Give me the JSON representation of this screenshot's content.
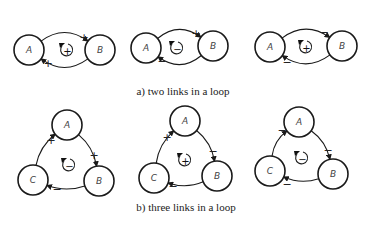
{
  "captions": {
    "a": "a) two links in a loop",
    "b": "b) three links in a loop"
  },
  "node_radius": 15,
  "panels": [
    {
      "id": "a1",
      "nodes": [
        {
          "label": "A",
          "x": 29,
          "y": 50
        },
        {
          "label": "B",
          "x": 100,
          "y": 50
        }
      ],
      "links": [
        {
          "from": 0,
          "to": 1,
          "bend": -26,
          "sign": "+",
          "sign_x": 84,
          "sign_y": 37
        },
        {
          "from": 1,
          "to": 0,
          "bend": -26,
          "sign": "+",
          "sign_x": 48,
          "sign_y": 63
        }
      ],
      "loop": {
        "x": 67,
        "y": 50,
        "sign": "+"
      }
    },
    {
      "id": "a2",
      "nodes": [
        {
          "label": "A",
          "x": 146,
          "y": 48
        },
        {
          "label": "B",
          "x": 213,
          "y": 46
        }
      ],
      "links": [
        {
          "from": 0,
          "to": 1,
          "bend": -26,
          "sign": "+",
          "sign_x": 196,
          "sign_y": 33
        },
        {
          "from": 1,
          "to": 0,
          "bend": -26,
          "sign": "−",
          "sign_x": 162,
          "sign_y": 61
        }
      ],
      "loop": {
        "x": 177,
        "y": 48,
        "sign": "−"
      }
    },
    {
      "id": "a3",
      "nodes": [
        {
          "label": "A",
          "x": 270,
          "y": 47
        },
        {
          "label": "B",
          "x": 342,
          "y": 46
        }
      ],
      "links": [
        {
          "from": 0,
          "to": 1,
          "bend": -26,
          "sign": "−",
          "sign_x": 324,
          "sign_y": 32
        },
        {
          "from": 1,
          "to": 0,
          "bend": -26,
          "sign": "−",
          "sign_x": 287,
          "sign_y": 62
        }
      ],
      "loop": {
        "x": 306,
        "y": 47,
        "sign": "+"
      }
    },
    {
      "id": "b1",
      "nodes": [
        {
          "label": "A",
          "x": 67,
          "y": 125
        },
        {
          "label": "B",
          "x": 99,
          "y": 181
        },
        {
          "label": "C",
          "x": 33,
          "y": 180
        }
      ],
      "links": [
        {
          "from": 0,
          "to": 1,
          "bend": -12,
          "sign": "+",
          "sign_x": 94,
          "sign_y": 155
        },
        {
          "from": 1,
          "to": 2,
          "bend": -12,
          "sign": "−",
          "sign_x": 57,
          "sign_y": 189
        },
        {
          "from": 2,
          "to": 0,
          "bend": -12,
          "sign": "+",
          "sign_x": 51,
          "sign_y": 140
        }
      ],
      "loop": {
        "x": 69,
        "y": 165,
        "sign": "−"
      }
    },
    {
      "id": "b2",
      "nodes": [
        {
          "label": "A",
          "x": 185,
          "y": 121
        },
        {
          "label": "B",
          "x": 217,
          "y": 176
        },
        {
          "label": "C",
          "x": 154,
          "y": 178
        }
      ],
      "links": [
        {
          "from": 0,
          "to": 1,
          "bend": -12,
          "sign": "−",
          "sign_x": 213,
          "sign_y": 151
        },
        {
          "from": 1,
          "to": 2,
          "bend": -12,
          "sign": "−",
          "sign_x": 173,
          "sign_y": 186
        },
        {
          "from": 2,
          "to": 0,
          "bend": -12,
          "sign": "+",
          "sign_x": 167,
          "sign_y": 137
        }
      ],
      "loop": {
        "x": 185,
        "y": 160,
        "sign": "+"
      }
    },
    {
      "id": "b3",
      "nodes": [
        {
          "label": "A",
          "x": 299,
          "y": 122
        },
        {
          "label": "B",
          "x": 333,
          "y": 174
        },
        {
          "label": "C",
          "x": 270,
          "y": 171
        }
      ],
      "links": [
        {
          "from": 0,
          "to": 1,
          "bend": -12,
          "sign": "−",
          "sign_x": 328,
          "sign_y": 150
        },
        {
          "from": 1,
          "to": 2,
          "bend": -12,
          "sign": "−",
          "sign_x": 287,
          "sign_y": 184
        },
        {
          "from": 2,
          "to": 0,
          "bend": -12,
          "sign": "−",
          "sign_x": 282,
          "sign_y": 130
        }
      ],
      "loop": {
        "x": 302,
        "y": 158,
        "sign": "−"
      }
    }
  ]
}
